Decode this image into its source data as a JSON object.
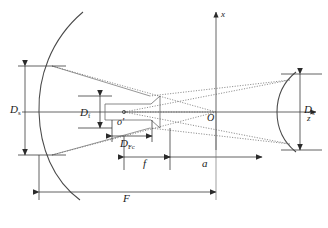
{
  "figure": {
    "type": "optical-ray-diagram",
    "background_color": "#ffffff",
    "line_color": "#3c3c3c",
    "text_color": "#1a1a1a"
  },
  "axes": {
    "vertical_label": "x",
    "horizontal_label": "z",
    "origin_label": "O"
  },
  "points": {
    "feed_label": "o'"
  },
  "dimensions": {
    "main_aperture": {
      "symbol": "D",
      "subscript": "s"
    },
    "sub_aperture": {
      "symbol": "D",
      "subscript": "s"
    },
    "feed_aperture": {
      "symbol": "D",
      "subscript": "f"
    },
    "phase_center": {
      "symbol": "D",
      "subscript": "Fc"
    },
    "focal_length": {
      "symbol": "f",
      "subscript": ""
    },
    "axial_offset": {
      "symbol": "a",
      "subscript": ""
    },
    "system_focal_length": {
      "symbol": "F",
      "subscript": ""
    }
  },
  "elements": {
    "main_reflector": "parabolic-main-reflector",
    "sub_reflector": "concave-sub-reflector",
    "feed_horn": "feed-horn",
    "rays": "dotted-ray-bundle"
  }
}
